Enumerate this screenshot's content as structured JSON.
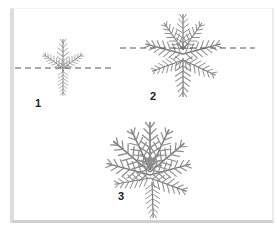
{
  "figure": {
    "colors": {
      "foliage": "#8a8a8a",
      "foliage_dark": "#6e6e6e",
      "cut_line": "#555555",
      "frame_shadow": "#d6d6d6"
    },
    "panels": [
      {
        "id": 1,
        "label": "1"
      },
      {
        "id": 2,
        "label": "2"
      },
      {
        "id": 3,
        "label": "3"
      }
    ]
  }
}
